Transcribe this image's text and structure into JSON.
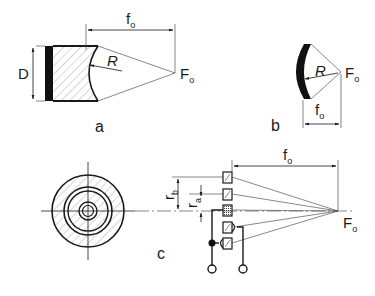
{
  "figure": {
    "panels": [
      {
        "id": "a",
        "caption": "a",
        "description": "Solid focusing transducer with concave lens",
        "labels": {
          "diameter": "D",
          "radius": "R",
          "focal_length": "f",
          "focal_length_sub": "o",
          "focus": "F",
          "focus_sub": "o"
        }
      },
      {
        "id": "b",
        "caption": "b",
        "description": "Curved (spherical shell) transducer",
        "labels": {
          "radius": "R",
          "focal_length": "f",
          "focal_length_sub": "o",
          "focus": "F",
          "focus_sub": "o"
        }
      },
      {
        "id": "c",
        "caption": "c",
        "description": "Annular array transducer (front view and cross-section) with electrical connections",
        "labels": {
          "radius_b": "r",
          "radius_b_sub": "b",
          "radius_a": "r",
          "radius_a_sub": "a",
          "focal_length": "f",
          "focal_length_sub": "o",
          "focus": "F",
          "focus_sub": "o"
        }
      }
    ],
    "colors": {
      "ink": "#1a1a1a",
      "hatch": "#8a8a8a",
      "background": "#ffffff"
    }
  }
}
